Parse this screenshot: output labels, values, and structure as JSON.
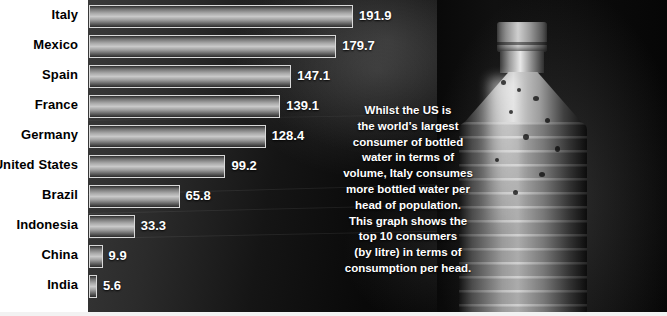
{
  "figure": {
    "background_color": "#0a0a0a",
    "label_color": "#000000",
    "value_color": "#ffffff",
    "bar_light": "#c9c9c9",
    "bar_dark": "#2a2a2a"
  },
  "chart_data": {
    "type": "bar",
    "orientation": "horizontal",
    "title": "",
    "xlabel": "",
    "ylabel": "",
    "unit": "litres per head",
    "grid": false,
    "legend": false,
    "xlim": [
      0,
      200
    ],
    "categories": [
      "Italy",
      "Mexico",
      "Spain",
      "France",
      "Germany",
      "United States",
      "Brazil",
      "Indonesia",
      "China",
      "India"
    ],
    "values": [
      191.9,
      179.7,
      147.1,
      139.1,
      128.4,
      99.2,
      65.8,
      33.3,
      9.9,
      5.6
    ],
    "value_labels": [
      "191.9",
      "179.7",
      "147.1",
      "139.1",
      "128.4",
      "99.2",
      "65.8",
      "33.3",
      "9.9",
      "5.6"
    ]
  },
  "caption": {
    "lines": [
      "Whilst the US is",
      "the world’s largest",
      "consumer of bottled",
      "water in terms of",
      "volume, Italy consumes",
      "more bottled water per",
      "head of population.",
      "This graph shows the",
      "top 10 consumers",
      "(by litre) in terms of",
      "consumption per head."
    ]
  },
  "photo": {
    "subject": "water-bottle-photo",
    "description": "plastic bottle of water"
  }
}
